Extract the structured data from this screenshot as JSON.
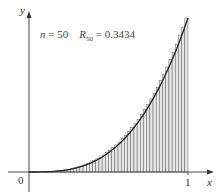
{
  "chart_data": {
    "type": "bar",
    "title": "",
    "annotation": {
      "n_label": "n",
      "n_value": "50",
      "R_label": "R",
      "R_sub": "50",
      "R_value": "0.3434"
    },
    "function": "x^3",
    "n": 50,
    "method": "right endpoint Riemann sum",
    "xlabel": "x",
    "ylabel": "y",
    "xlim": [
      0,
      1
    ],
    "ylim": [
      0,
      1
    ],
    "x_ticks": [
      "0",
      "1"
    ],
    "grid": false,
    "legend": null,
    "categories": [
      0.02,
      0.04,
      0.06,
      0.08,
      0.1,
      0.12,
      0.14,
      0.16,
      0.18,
      0.2,
      0.22,
      0.24,
      0.26,
      0.28,
      0.3,
      0.32,
      0.34,
      0.36,
      0.38,
      0.4,
      0.42,
      0.44,
      0.46,
      0.48,
      0.5,
      0.52,
      0.54,
      0.56,
      0.58,
      0.6,
      0.62,
      0.64,
      0.66,
      0.68,
      0.7,
      0.72,
      0.74,
      0.76,
      0.78,
      0.8,
      0.82,
      0.84,
      0.86,
      0.88,
      0.9,
      0.92,
      0.94,
      0.96,
      0.98,
      1.0
    ],
    "values": [
      8e-06,
      6.4e-05,
      0.000216,
      0.000512,
      0.001,
      0.001728,
      0.002744,
      0.004096,
      0.005832,
      0.008,
      0.010648,
      0.013824,
      0.017576,
      0.021952,
      0.027,
      0.032768,
      0.039304,
      0.046656,
      0.054872,
      0.064,
      0.074088,
      0.085184,
      0.097336,
      0.110592,
      0.125,
      0.140608,
      0.157464,
      0.175616,
      0.195112,
      0.216,
      0.238328,
      0.262144,
      0.287496,
      0.314432,
      0.343,
      0.373248,
      0.405224,
      0.438976,
      0.474552,
      0.512,
      0.551368,
      0.592704,
      0.636056,
      0.681472,
      0.729,
      0.778688,
      0.830584,
      0.884736,
      0.941192,
      1.0
    ]
  },
  "labels": {
    "origin": "0",
    "x_tick_one": "1",
    "x_axis": "x",
    "y_axis": "y",
    "eq": "=",
    "eq2": "="
  },
  "colors": {
    "bar_fill": "#e6e6e6",
    "bar_stroke": "#555555",
    "curve": "#222222",
    "axis": "#333333"
  }
}
